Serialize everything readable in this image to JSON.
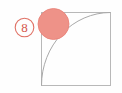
{
  "figure": {
    "canvas": {
      "width": 122,
      "height": 93,
      "background_color": "#FEFEFE"
    },
    "problem_number_badge": {
      "label": "8",
      "shape": "circle-outline",
      "center_x": 24.5,
      "center_y": 27.5,
      "radius": 9.3,
      "stroke_color": "#E07266",
      "stroke_width": 1.1,
      "text_color": "#D4554A",
      "fill_color": "none"
    },
    "square": {
      "name": "square-outline",
      "x": 41.5,
      "y": 12.5,
      "width": 69,
      "height": 73,
      "stroke_color": "#B8B8B8",
      "stroke_width": 1.0,
      "fill_color": "none"
    },
    "quarter_arc": {
      "name": "quarter-circle-arc",
      "description": "quarter circle centered at bottom-right corner of square, from bottom-left corner to top-right corner",
      "center_x": 110.5,
      "center_y": 85.5,
      "radius": 69,
      "start_x": 41.5,
      "start_y": 85.5,
      "end_x": 110.5,
      "end_y": 12.5,
      "stroke_color": "#A9A9A9",
      "stroke_width": 1.0,
      "fill_color": "none"
    },
    "shaded_circle": {
      "name": "shaded-circle",
      "center_x": 53.5,
      "center_y": 24.0,
      "radius": 15.5,
      "fill_color": "#EE9288",
      "stroke_color": "#E88076",
      "stroke_width": 0.8
    }
  }
}
